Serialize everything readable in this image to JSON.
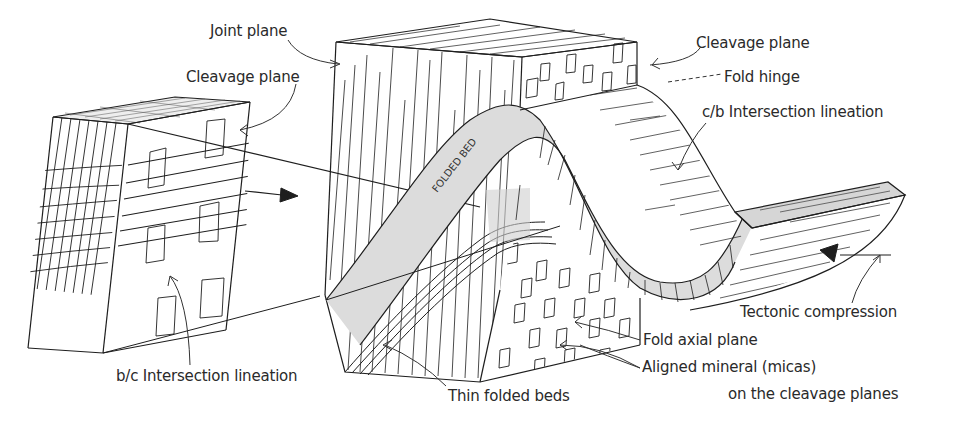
{
  "diagram": {
    "colors": {
      "ink": "#1e1e1e",
      "label_text": "#2a2a2a",
      "bed_fill": "#dcdcdc",
      "background": "#ffffff"
    },
    "labels": {
      "joint_plane": "Joint plane",
      "cleavage_plane_left": "Cleavage plane",
      "cleavage_plane_right": "Cleavage plane",
      "fold_hinge": "Fold hinge",
      "cb_intersection_lineation": "c/b Intersection lineation",
      "bc_intersection_lineation": "b/c Intersection lineation",
      "thin_folded_beds": "Thin folded beds",
      "fold_axial_plane": "Fold axial plane",
      "aligned_mineral_line1": "Aligned mineral (micas)",
      "aligned_mineral_line2": "on the cleavage planes",
      "tectonic_compression": "Tectonic compression",
      "folded_bed": "FOLDED BED"
    },
    "blocks": [
      {
        "name": "small-block",
        "description": "Detached block showing cleavage planes and b/c intersection lineation"
      },
      {
        "name": "large-block",
        "description": "Folded block with joint plane, folded bed, thin folded beds and cleavage"
      }
    ],
    "arrows": [
      {
        "name": "transfer-arrow",
        "direction": "right"
      },
      {
        "name": "compression-arrow",
        "direction": "left"
      }
    ]
  }
}
